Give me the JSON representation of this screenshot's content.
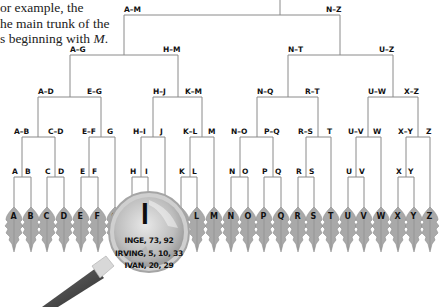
{
  "intro_text": {
    "line1": "or example, the",
    "line2": "he main trunk of the",
    "line3_prefix": "s beginning with ",
    "line3_italic": "M",
    "line3_suffix": "."
  },
  "tree": {
    "level1": [
      "A–M",
      "N–Z"
    ],
    "level2": [
      "A–G",
      "H–M",
      "N–T",
      "U–Z"
    ],
    "level3": [
      "A–D",
      "E–G",
      "H–J",
      "K–M",
      "N–Q",
      "R–T",
      "U–W",
      "X–Z"
    ],
    "level4": [
      "A–B",
      "C–D",
      "E–F",
      "G",
      "H–I",
      "J",
      "K–L",
      "M",
      "N–O",
      "P–Q",
      "R–S",
      "T",
      "U–V",
      "W",
      "X–Y",
      "Z"
    ],
    "level5": [
      "A",
      "B",
      "C",
      "D",
      "E",
      "F",
      "H",
      "I",
      "K",
      "L",
      "N",
      "O",
      "P",
      "Q",
      "R",
      "S",
      "U",
      "V",
      "X",
      "Y"
    ],
    "leaves": [
      "A",
      "B",
      "C",
      "D",
      "E",
      "F",
      "G",
      "H",
      "I",
      "J",
      "K",
      "L",
      "M",
      "N",
      "O",
      "P",
      "Q",
      "R",
      "S",
      "T",
      "U",
      "V",
      "W",
      "X",
      "Y",
      "Z"
    ]
  },
  "magnifier": {
    "letter": "I",
    "entries": [
      "INGE, 73, 92",
      "IRVING, 5, 10, 33",
      "IVAN, 20, 29"
    ]
  },
  "colors": {
    "line": "#8a8a8a",
    "leaf": "#a8a8a8",
    "leaf_dark": "#8c8c8c",
    "lens": "#c9c9c9",
    "handle": "#4a4a4a"
  }
}
